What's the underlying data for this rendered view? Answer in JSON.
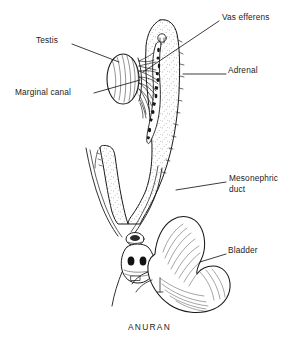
{
  "figure": {
    "caption": "ANURAN",
    "background_color": "#ffffff",
    "ink_color": "#1a1a1a"
  },
  "labels": [
    {
      "id": "testis",
      "text": "Testis",
      "x": 36,
      "y": 40,
      "align": "left"
    },
    {
      "id": "vas-efferens",
      "text": "Vas efferens",
      "x": 222,
      "y": 17,
      "align": "left"
    },
    {
      "id": "adrenal",
      "text": "Adrenal",
      "x": 228,
      "y": 70,
      "align": "left"
    },
    {
      "id": "marginal-canal",
      "text": "Marginal canal",
      "x": 15,
      "y": 92,
      "align": "left"
    },
    {
      "id": "mesonephric-duct",
      "text": "Mesonephric duct",
      "line1": "Mesonephric",
      "line2": "duct",
      "x": 229,
      "y": 178,
      "align": "left"
    },
    {
      "id": "bladder",
      "text": "Bladder",
      "x": 228,
      "y": 250,
      "align": "left"
    }
  ],
  "leaders": [
    {
      "id": "testis-leader",
      "from": [
        72,
        44
      ],
      "to": [
        119,
        62
      ]
    },
    {
      "id": "vas-efferens-leader",
      "from": [
        219,
        21
      ],
      "to": [
        143,
        72
      ]
    },
    {
      "id": "adrenal-leader",
      "from": [
        226,
        74
      ],
      "to": [
        183,
        74
      ]
    },
    {
      "id": "marginal-canal-leader",
      "from": [
        94,
        93
      ],
      "to": [
        140,
        80
      ]
    },
    {
      "id": "mesonephric-duct-leader",
      "from": [
        226,
        182
      ],
      "to": [
        176,
        190
      ]
    },
    {
      "id": "bladder-leader",
      "from": [
        226,
        254
      ],
      "to": [
        200,
        262
      ]
    }
  ],
  "structures": [
    {
      "id": "testis",
      "name": "Testis",
      "description": "Oval hatched body at left of kidney"
    },
    {
      "id": "kidney",
      "name": "Mesonephric kidney",
      "description": "Elongate stippled organ, right of testis"
    },
    {
      "id": "adrenal",
      "name": "Adrenal",
      "description": "Dark irregular strip along kidney face"
    },
    {
      "id": "vasa-efferentia",
      "name": "Vasa efferentia",
      "description": "Fine tubules fanning from testis to kidney"
    },
    {
      "id": "marginal-canal",
      "name": "Marginal canal",
      "description": "Canal along testis margin"
    },
    {
      "id": "mesonephric-duct",
      "name": "Mesonephric duct",
      "description": "Paired ducts running to cloaca"
    },
    {
      "id": "cloaca",
      "name": "Cloaca",
      "description": "Chamber with paired dark apertures"
    },
    {
      "id": "bladder",
      "name": "Bladder",
      "description": "Bilobed striated sac at lower right"
    }
  ]
}
